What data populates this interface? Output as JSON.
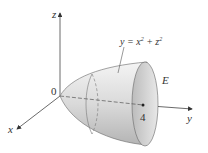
{
  "figure": {
    "axes": {
      "x_label": "x",
      "y_label": "y",
      "z_label": "z",
      "origin_label": "0"
    },
    "surface_equation": {
      "lhs": "y = x",
      "x_exp": "2",
      "plus": " + z",
      "z_exp": "2"
    },
    "region_label": "E",
    "tick_label": "4",
    "colors": {
      "surface_light": "#f2f2f2",
      "surface_dark": "#a8a8a8",
      "axis": "#444444"
    }
  }
}
